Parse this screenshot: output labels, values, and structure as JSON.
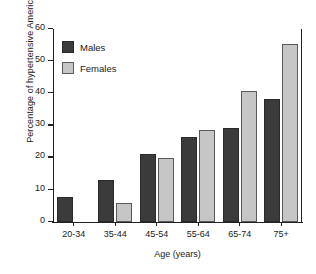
{
  "chart_data": {
    "type": "bar",
    "title": "",
    "xlabel": "Age (years)",
    "ylabel": "Percentage of hypertensive Americans",
    "categories": [
      "20-34",
      "35-44",
      "45-54",
      "55-64",
      "65-74",
      "75+"
    ],
    "series": [
      {
        "name": "Males",
        "color": "#3b3b3b",
        "values": [
          7.8,
          13.2,
          21.0,
          26.4,
          29.2,
          38.2
        ]
      },
      {
        "name": "Females",
        "color": "#c6c6c6",
        "values": [
          0.0,
          5.8,
          19.9,
          28.5,
          40.7,
          55.3
        ]
      }
    ],
    "ylim": [
      0,
      60
    ],
    "yticks": [
      0,
      10,
      20,
      30,
      40,
      50,
      60
    ],
    "ytick_labels": [
      "0",
      "10",
      "20",
      "30",
      "40",
      "50",
      "60"
    ],
    "grid": false,
    "legend_position": "upper-left"
  }
}
